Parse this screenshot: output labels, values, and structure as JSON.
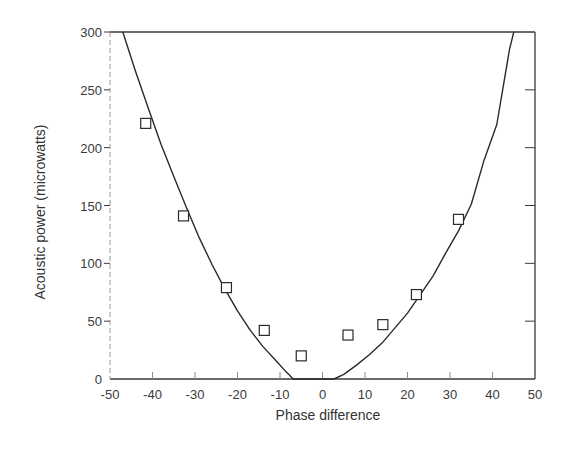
{
  "chart_data": {
    "type": "scatter",
    "title": "",
    "xlabel": "Phase difference",
    "ylabel": "Acoustic power (microwatts)",
    "xlim": [
      -50,
      50
    ],
    "ylim": [
      0,
      300
    ],
    "grid": false,
    "legend": null,
    "x_ticks": [
      -50,
      -40,
      -30,
      -20,
      -10,
      0,
      10,
      20,
      30,
      40,
      50
    ],
    "x_tick_labels": [
      "-50",
      "-40",
      "-30",
      "-20",
      "-10",
      "0",
      "10",
      "20",
      "30",
      "40",
      "50"
    ],
    "y_ticks": [
      0,
      50,
      100,
      150,
      200,
      250,
      300
    ],
    "y_tick_labels": [
      "0",
      "50",
      "100",
      "150",
      "200",
      "250",
      "300"
    ],
    "series": [
      {
        "name": "Measured",
        "kind": "scatter",
        "marker": "open-square",
        "x": [
          -41.6,
          -32.7,
          -22.6,
          -13.7,
          -5.0,
          6.0,
          14.2,
          22.1,
          32.0
        ],
        "y": [
          221,
          141,
          79,
          42,
          20,
          38,
          47,
          73,
          138
        ]
      },
      {
        "name": "Fitted curve",
        "kind": "line",
        "x": [
          -47,
          -44,
          -41,
          -38,
          -35,
          -32,
          -29,
          -26,
          -23,
          -20,
          -17,
          -14,
          -11,
          -8.5,
          -6.9,
          2.7,
          5,
          8,
          11,
          14,
          17,
          20,
          23,
          26,
          29,
          32,
          35,
          38,
          41,
          44,
          45
        ],
        "y": [
          300,
          266,
          234,
          203,
          175,
          148,
          122,
          99,
          78,
          59,
          42,
          28,
          16,
          6,
          0,
          0,
          4,
          12,
          21,
          31,
          44,
          57,
          73,
          89,
          109,
          128,
          151,
          189,
          220,
          285,
          300
        ]
      }
    ],
    "colors": {
      "ink": "#2a2a2a",
      "axis": "#3a3a3a",
      "background": "#ffffff"
    }
  }
}
